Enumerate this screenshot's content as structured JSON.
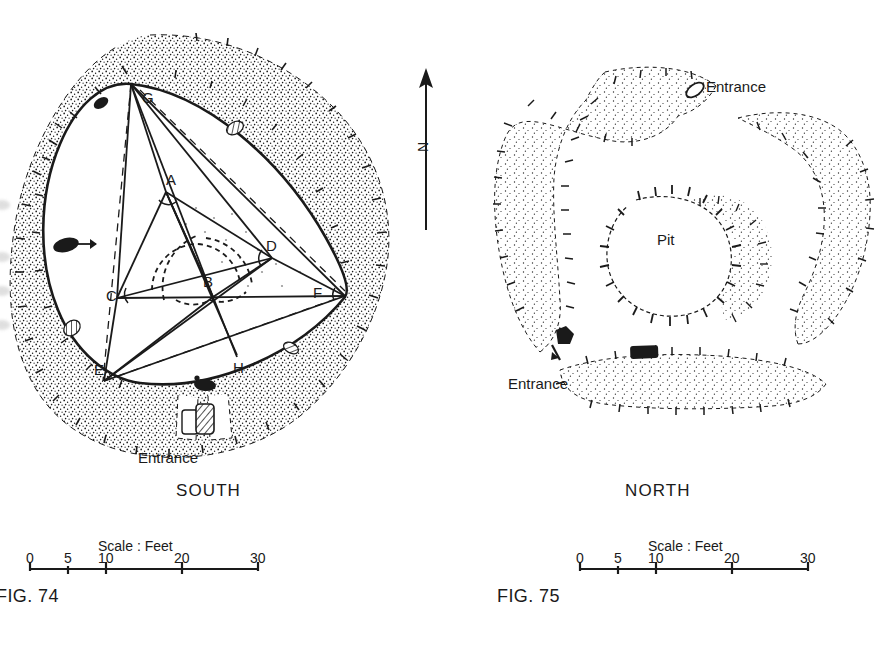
{
  "figure": {
    "type": "archaeological-site-plans",
    "background": "#ffffff",
    "ink": "#1a1a1a"
  },
  "left_plan": {
    "caption": "SOUTH",
    "fig_label": "FIG. 74",
    "entrance_label": "Entrance",
    "description": "Rounded-triangular stone ring with surrounding stippled bank and internal geometric construction",
    "point_labels": [
      {
        "id": "A",
        "label": "A",
        "x": 166,
        "y": 179
      },
      {
        "id": "B",
        "label": "B",
        "x": 207,
        "y": 281
      },
      {
        "id": "C",
        "label": "C",
        "x": 111,
        "y": 299
      },
      {
        "id": "D",
        "label": "D",
        "x": 270,
        "y": 246
      },
      {
        "id": "E",
        "label": "E",
        "x": 98,
        "y": 372
      },
      {
        "id": "F",
        "label": "F",
        "x": 317,
        "y": 294
      },
      {
        "id": "G",
        "label": "G",
        "x": 146,
        "y": 98
      },
      {
        "id": "H",
        "label": "H",
        "x": 237,
        "y": 368
      }
    ],
    "scale": {
      "title": "Scale : Feet",
      "ticks": [
        {
          "label": "0",
          "value": 0
        },
        {
          "label": "5",
          "value": 5
        },
        {
          "label": "10",
          "value": 10
        },
        {
          "label": "20",
          "value": 20
        },
        {
          "label": "30",
          "value": 30
        }
      ],
      "units": "Feet",
      "min": 0,
      "max": 30
    }
  },
  "right_plan": {
    "caption": "NORTH",
    "fig_label": "FIG. 75",
    "pit_label": "Pit",
    "entrance_labels": [
      {
        "id": "ne",
        "label": "Entrance"
      },
      {
        "id": "sw",
        "label": "Entrance"
      }
    ],
    "description": "Segmented ring of stippled banks with hachured inner edges around a central pit",
    "scale": {
      "title": "Scale : Feet",
      "ticks": [
        {
          "label": "0",
          "value": 0
        },
        {
          "label": "5",
          "value": 5
        },
        {
          "label": "10",
          "value": 10
        },
        {
          "label": "20",
          "value": 20
        },
        {
          "label": "30",
          "value": 30
        }
      ],
      "units": "Feet",
      "min": 0,
      "max": 30
    }
  },
  "north_arrow": {
    "label": "N"
  }
}
